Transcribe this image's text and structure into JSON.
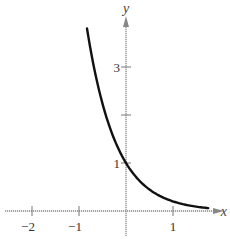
{
  "chart_data": {
    "type": "line",
    "title": "",
    "xlabel": "x",
    "ylabel": "y",
    "xlim": [
      -2.5,
      1.9
    ],
    "ylim": [
      -0.7,
      4.3
    ],
    "grid": false,
    "x_ticks": [
      -2,
      -1,
      1
    ],
    "x_tick_labels": [
      "−2",
      "−1",
      "1"
    ],
    "y_ticks": [
      1,
      2,
      3
    ],
    "y_tick_labels": [
      "1",
      "",
      "3"
    ],
    "series": [
      {
        "name": "y = (1/5)^x",
        "x": [
          -0.83,
          -0.6,
          -0.4,
          -0.2,
          0,
          0.2,
          0.4,
          0.6,
          0.8,
          1.0,
          1.2,
          1.4,
          1.6,
          1.75
        ],
        "values": [
          3.8,
          2.63,
          1.9,
          1.38,
          1.0,
          0.72,
          0.53,
          0.38,
          0.28,
          0.2,
          0.14,
          0.11,
          0.08,
          0.06
        ]
      }
    ],
    "annotations": []
  }
}
